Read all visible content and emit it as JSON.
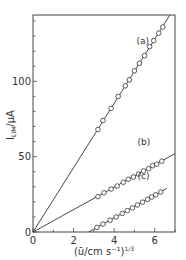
{
  "chart_data": {
    "type": "scatter",
    "title": "",
    "xlabel": "(ū/cm s⁻¹)^1/3",
    "ylabel": "I_LIM / μA",
    "xlim": [
      0,
      7
    ],
    "ylim": [
      0,
      144
    ],
    "xticks": [
      0,
      2,
      4,
      6
    ],
    "xminor": [
      1,
      3,
      5,
      7
    ],
    "yticks": [
      0,
      50,
      100
    ],
    "yminor": [
      10,
      20,
      30,
      40,
      60,
      70,
      80,
      90,
      110,
      120,
      130,
      140
    ],
    "grid": false,
    "series": [
      {
        "name": "(a)",
        "label_at": [
          5.1,
          125
        ],
        "fit": {
          "x": [
            0,
            6.75
          ],
          "y": [
            0,
            144
          ]
        },
        "x": [
          3.2,
          3.45,
          3.85,
          4.2,
          4.55,
          4.75,
          5.0,
          5.25,
          5.5,
          5.75,
          5.95,
          6.2,
          6.4
        ],
        "y": [
          68,
          74,
          82,
          90,
          97,
          101,
          107,
          112,
          117,
          123,
          127,
          132,
          136
        ]
      },
      {
        "name": "(b)",
        "label_at": [
          5.15,
          58
        ],
        "fit": {
          "x": [
            0,
            7
          ],
          "y": [
            0,
            52
          ]
        },
        "x": [
          3.2,
          3.5,
          3.85,
          4.15,
          4.45,
          4.7,
          4.95,
          5.2,
          5.45,
          5.7,
          5.9,
          6.1,
          6.35
        ],
        "y": [
          23.5,
          26,
          28.5,
          30.5,
          33,
          35,
          36.5,
          38.5,
          40.5,
          42,
          44,
          45,
          47
        ]
      },
      {
        "name": "(c)",
        "label_at": [
          5.15,
          35
        ],
        "fit": {
          "x": [
            2.75,
            6.6
          ],
          "y": [
            0,
            29
          ]
        },
        "x": [
          3.15,
          3.45,
          3.8,
          4.1,
          4.4,
          4.65,
          4.9,
          5.15,
          5.4,
          5.65,
          5.85,
          6.05,
          6.3
        ],
        "y": [
          3,
          5.3,
          7.8,
          10,
          12.3,
          14.2,
          16,
          17.9,
          19.8,
          21.6,
          23.2,
          24.7,
          26.5
        ]
      }
    ]
  },
  "labels": {
    "x_tick": [
      "0",
      "2",
      "4",
      "6"
    ],
    "y_tick": [
      "0",
      "50",
      "100"
    ],
    "xlabel": "(ū/cm s⁻¹)",
    "xlabel_exp": "1/3",
    "ylabel_main": "I",
    "ylabel_sub": "LIM",
    "ylabel_unit": "/μA",
    "series": [
      "(a)",
      "(b)",
      "(c)"
    ]
  }
}
